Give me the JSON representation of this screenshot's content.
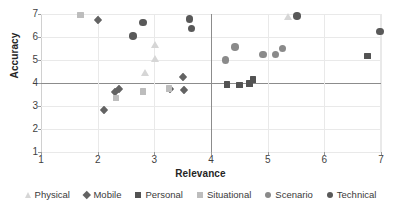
{
  "chart_data": {
    "type": "scatter",
    "title": "",
    "xlabel": "Relevance",
    "ylabel": "Accuracy",
    "xlim": [
      1,
      7
    ],
    "ylim": [
      1,
      7
    ],
    "xticks": [
      "1",
      "2",
      "3",
      "4",
      "5",
      "6",
      "7"
    ],
    "yticks": [
      "1",
      "2",
      "3",
      "4",
      "5",
      "6",
      "7"
    ],
    "grid": true,
    "legend_position": "bottom",
    "reference_lines": {
      "x": 4.0,
      "y": 4.0
    },
    "series": [
      {
        "name": "Physical",
        "marker": "triangle",
        "color": "#d6d6d6",
        "points": [
          {
            "x": 3.02,
            "y": 5.68
          },
          {
            "x": 3.02,
            "y": 5.06
          },
          {
            "x": 2.84,
            "y": 4.44
          },
          {
            "x": 5.36,
            "y": 6.88
          }
        ]
      },
      {
        "name": "Mobile",
        "marker": "diamond",
        "color": "#636363",
        "points": [
          {
            "x": 2.0,
            "y": 6.76
          },
          {
            "x": 2.12,
            "y": 2.84
          },
          {
            "x": 2.3,
            "y": 3.6
          },
          {
            "x": 2.37,
            "y": 3.72
          },
          {
            "x": 3.28,
            "y": 3.76
          },
          {
            "x": 3.5,
            "y": 4.28
          },
          {
            "x": 3.52,
            "y": 3.7
          }
        ]
      },
      {
        "name": "Personal",
        "marker": "square",
        "color": "#535353",
        "points": [
          {
            "x": 4.28,
            "y": 3.94
          },
          {
            "x": 4.5,
            "y": 3.92
          },
          {
            "x": 4.68,
            "y": 3.98
          },
          {
            "x": 4.74,
            "y": 4.16
          },
          {
            "x": 6.76,
            "y": 5.18
          }
        ]
      },
      {
        "name": "Situational",
        "marker": "square",
        "color": "#bdbdbd",
        "points": [
          {
            "x": 1.7,
            "y": 6.96
          },
          {
            "x": 2.32,
            "y": 3.34
          },
          {
            "x": 2.8,
            "y": 3.62
          },
          {
            "x": 3.26,
            "y": 3.76
          }
        ]
      },
      {
        "name": "Scenario",
        "marker": "circle",
        "color": "#8a8a8a",
        "points": [
          {
            "x": 4.26,
            "y": 5.0
          },
          {
            "x": 4.42,
            "y": 5.56
          },
          {
            "x": 4.92,
            "y": 5.24
          },
          {
            "x": 5.14,
            "y": 5.24
          },
          {
            "x": 5.26,
            "y": 5.5
          }
        ]
      },
      {
        "name": "Technical",
        "marker": "circle",
        "color": "#595959",
        "points": [
          {
            "x": 2.62,
            "y": 6.04
          },
          {
            "x": 2.8,
            "y": 6.64
          },
          {
            "x": 3.62,
            "y": 6.78
          },
          {
            "x": 3.66,
            "y": 6.38
          },
          {
            "x": 5.52,
            "y": 6.92
          },
          {
            "x": 6.98,
            "y": 6.24
          }
        ]
      }
    ]
  },
  "legend": {
    "items": [
      {
        "label": "Physical",
        "marker": "triangle",
        "color": "#d6d6d6"
      },
      {
        "label": "Mobile",
        "marker": "diamond",
        "color": "#636363"
      },
      {
        "label": "Personal",
        "marker": "square",
        "color": "#535353"
      },
      {
        "label": "Situational",
        "marker": "square",
        "color": "#bdbdbd"
      },
      {
        "label": "Scenario",
        "marker": "circle",
        "color": "#8a8a8a"
      },
      {
        "label": "Technical",
        "marker": "circle",
        "color": "#595959"
      }
    ]
  }
}
